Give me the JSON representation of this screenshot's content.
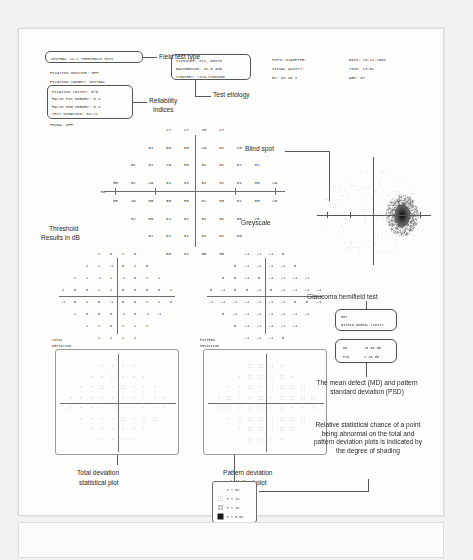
{
  "document": {
    "type": "Humphrey visual field analyzer printout",
    "field_test_type_label": "Field test type",
    "test_etiology_label": "Test etiology",
    "reliability_label": "Reliability\nindices"
  },
  "header": {
    "test_title": "CENTRAL 24-2 THRESHOLD TEST",
    "reliability": [
      "FIXATION MONITOR: OFF",
      "FIXATION TARGET: CENTRAL",
      "FIXATION LOSSES: 0/0",
      "FALSE POS ERRORS: 0 %",
      "FALSE NEG ERRORS: 0 %",
      "TEST DURATION: 04:21",
      "FOVEA: OFF"
    ],
    "etiology": [
      "STIMULUS: III, WHITE",
      "BACKGROUND: 31.5 ASB",
      "STRATEGY: SITA-STANDARD"
    ],
    "patient": [
      "PUPIL DIAMETER:",
      "VISUAL ACUITY:",
      "RX:        DS        DC     X"
    ],
    "exam": [
      "DATE: 25-11-2004",
      "TIME: 13:52",
      "AGE: 57"
    ]
  },
  "annotations": {
    "field_test_type": "Field test type",
    "test_etiology": "Test etiology",
    "reliability_indices_line1": "Reliability",
    "reliability_indices_line2": "indices",
    "threshold_line1": "Threshold",
    "threshold_line2": "Results in dB",
    "blind_spot": "Blind spot",
    "greyscale": "Greyscale",
    "ght": "Glaucoma hemifield test",
    "md_psd": "The mean defect (MD) and pattern standard deviation (PSD)",
    "shading": "Relative statistical chance of a point being abnormal on the total and pattern deviation plots is indicated by the degree of shading",
    "total_dev_plot_line1": "Total deviation",
    "total_dev_plot_line2": "statistical plot",
    "pattern_dev_plot_line1": "Pattern deviation",
    "pattern_dev_plot_line2": "statistical plot",
    "total_deviation_label_line1": "TOTAL",
    "total_deviation_label_line2": "DEVIATION",
    "pattern_deviation_label_line1": "PATTERN",
    "pattern_deviation_label_line2": "DEVIATION"
  },
  "results": {
    "ght_title": "GHT",
    "ght_value": "WITHIN NORMAL LIMITS",
    "md_label": "MD",
    "md_value": "+0.50 dB",
    "psd_label": "PSD",
    "psd_value": "1.40 dB"
  },
  "legend": {
    "rows": [
      {
        "symbol": "p5",
        "text": "P < 5%"
      },
      {
        "symbol": "p2",
        "text": "P < 2%"
      },
      {
        "symbol": "p1",
        "text": "P < 1%"
      },
      {
        "symbol": "p05",
        "text": "P < 0.5%"
      }
    ]
  },
  "chart_data": {
    "type": "heatmap",
    "title": "CENTRAL 24-2 THRESHOLD TEST",
    "xlabel": "",
    "ylabel": "",
    "units": "dB",
    "grid_spacing_deg": 6,
    "axis_tick_labels": [
      "30"
    ],
    "threshold_rows": [
      {
        "y": 21,
        "xs": [
          -9,
          -3,
          3,
          9
        ],
        "values": [
          27,
          27,
          28,
          27
        ]
      },
      {
        "y": 15,
        "xs": [
          -15,
          -9,
          -3,
          3,
          9,
          15
        ],
        "values": [
          31,
          30,
          30,
          29,
          31,
          28
        ]
      },
      {
        "y": 9,
        "xs": [
          -21,
          -15,
          -9,
          -3,
          3,
          9,
          15,
          21
        ],
        "values": [
          31,
          32,
          29,
          30,
          31,
          31,
          32,
          31
        ]
      },
      {
        "y": 3,
        "xs": [
          -27,
          -21,
          -15,
          -9,
          -3,
          3,
          9,
          15,
          21,
          27
        ],
        "values": [
          30,
          32,
          29,
          31,
          34,
          31,
          32,
          31,
          30,
          29
        ]
      },
      {
        "y": -3,
        "xs": [
          -27,
          -21,
          -15,
          -9,
          -3,
          3,
          9,
          15,
          21,
          27
        ],
        "values": [
          30,
          29,
          30,
          30,
          30,
          32,
          33,
          31,
          30,
          28
        ]
      },
      {
        "y": -9,
        "xs": [
          -21,
          -15,
          -9,
          -3,
          3,
          9,
          15,
          21
        ],
        "values": [
          32,
          30,
          32,
          32,
          31,
          31,
          30,
          28
        ]
      },
      {
        "y": -15,
        "xs": [
          -15,
          -9,
          -3,
          3,
          9,
          15
        ],
        "values": [
          32,
          31,
          31,
          31,
          31,
          30
        ]
      },
      {
        "y": -21,
        "xs": [
          -9,
          -3,
          3,
          9
        ],
        "values": [
          30,
          32,
          30,
          30
        ]
      }
    ],
    "total_deviation_rows": [
      {
        "y": 21,
        "xs": [
          -9,
          -3,
          3,
          9
        ],
        "values": [
          1,
          0,
          1,
          0
        ]
      },
      {
        "y": 15,
        "xs": [
          -15,
          -9,
          -3,
          3,
          9,
          15
        ],
        "values": [
          2,
          2,
          -1,
          0,
          1,
          0
        ]
      },
      {
        "y": 9,
        "xs": [
          -21,
          -15,
          -9,
          -3,
          3,
          9,
          15,
          21
        ],
        "values": [
          2,
          2,
          -1,
          1,
          -1,
          0,
          1,
          1
        ]
      },
      {
        "y": 3,
        "xs": [
          -27,
          -21,
          -15,
          -9,
          -3,
          3,
          9,
          15,
          21,
          27
        ],
        "values": [
          2,
          0,
          0,
          2,
          1,
          0,
          0,
          0,
          0,
          1
        ]
      },
      {
        "y": -3,
        "xs": [
          -27,
          -21,
          -15,
          -9,
          -3,
          3,
          9,
          15,
          21,
          27
        ],
        "values": [
          -1,
          0,
          1,
          0,
          -1,
          0,
          0,
          1,
          2,
          0
        ]
      },
      {
        "y": -9,
        "xs": [
          -21,
          -15,
          -9,
          -3,
          3,
          9,
          15,
          21
        ],
        "values": [
          2,
          0,
          0,
          0,
          -1,
          0,
          -1,
          -1
        ]
      },
      {
        "y": -15,
        "xs": [
          -15,
          -9,
          -3,
          3,
          9,
          15
        ],
        "values": [
          2,
          1,
          0,
          1,
          1,
          1
        ]
      },
      {
        "y": -21,
        "xs": [
          -9,
          -3,
          3,
          9
        ],
        "values": [
          1,
          2,
          1,
          1
        ]
      }
    ],
    "pattern_deviation_rows": [
      {
        "y": 21,
        "xs": [
          -9,
          -3,
          3,
          9
        ],
        "values": [
          -1,
          -1,
          -1,
          0
        ]
      },
      {
        "y": 15,
        "xs": [
          -15,
          -9,
          -3,
          3,
          9,
          15
        ],
        "values": [
          0,
          -1,
          -1,
          -1,
          -1,
          0
        ]
      },
      {
        "y": 9,
        "xs": [
          -21,
          -15,
          -9,
          -3,
          3,
          9,
          15,
          21
        ],
        "values": [
          0,
          0,
          -1,
          0,
          -1,
          -1,
          -1,
          -1
        ]
      },
      {
        "y": 3,
        "xs": [
          -27,
          -21,
          -15,
          -9,
          -3,
          3,
          9,
          15,
          21,
          27
        ],
        "values": [
          0,
          -2,
          0,
          0,
          -1,
          0,
          -1,
          -1,
          -1,
          -1
        ]
      },
      {
        "y": -3,
        "xs": [
          -27,
          -21,
          -15,
          -9,
          -3,
          3,
          9,
          15,
          21,
          27
        ],
        "values": [
          -1,
          -1,
          -1,
          -1,
          -1,
          -1,
          -1,
          0,
          0,
          -1
        ]
      },
      {
        "y": -9,
        "xs": [
          -21,
          -15,
          -9,
          -3,
          3,
          9,
          15,
          21
        ],
        "values": [
          0,
          -1,
          -1,
          -1,
          -1,
          -1,
          -1,
          -1
        ]
      },
      {
        "y": -15,
        "xs": [
          -15,
          -9,
          -3,
          3,
          9,
          15
        ],
        "values": [
          0,
          -1,
          -1,
          -1,
          -1,
          -1
        ]
      },
      {
        "y": -21,
        "xs": [
          -9,
          -3,
          3,
          9
        ],
        "values": [
          -1,
          -1,
          -1,
          0
        ]
      }
    ]
  }
}
